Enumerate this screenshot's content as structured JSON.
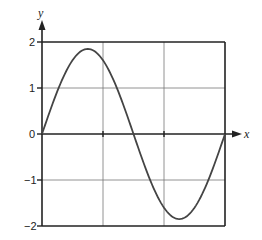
{
  "chart_data": {
    "type": "line",
    "title": "",
    "xlabel": "x",
    "ylabel": "y",
    "ylim": [
      -2,
      2
    ],
    "y_ticks": [
      "2",
      "1",
      "0",
      "-1",
      "-2"
    ],
    "x_ticks": [],
    "grid": true,
    "series": [
      {
        "name": "y = A sin(x)",
        "description": "One full period of a sine wave with amplitude about 1.85",
        "x_fraction": [
          0,
          0.125,
          0.25,
          0.375,
          0.5,
          0.625,
          0.75,
          0.875,
          1
        ],
        "values": [
          0,
          1.31,
          1.85,
          1.31,
          0,
          -1.31,
          -1.85,
          -1.31,
          0
        ]
      }
    ],
    "amplitude": 1.85
  },
  "labels": {
    "x_axis": "x",
    "y_axis": "y",
    "y2": "2",
    "y1": "1",
    "y0": "0",
    "ym1": "−1",
    "ym2": "−2"
  }
}
